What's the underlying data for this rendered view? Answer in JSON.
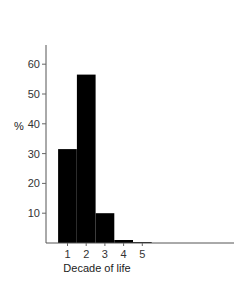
{
  "chart_data": {
    "type": "bar",
    "title": "",
    "xlabel": "Decade of life",
    "ylabel": "%",
    "categories": [
      "1",
      "2",
      "3",
      "4",
      "5"
    ],
    "values": [
      31.5,
      56.5,
      10,
      1,
      0.3
    ],
    "ylim": [
      0,
      64
    ],
    "xlim": [
      0.3,
      8.6
    ],
    "yticks": [
      10,
      20,
      30,
      40,
      50,
      60
    ],
    "xticks": [
      1,
      2,
      3,
      4,
      5
    ],
    "grid": false,
    "legend": null,
    "bar_color": "#000000"
  }
}
